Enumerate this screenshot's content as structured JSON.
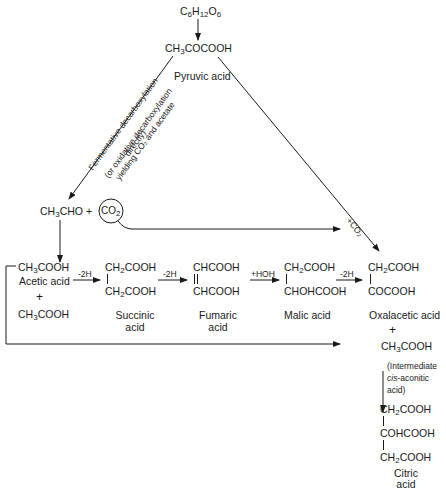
{
  "diagram": {
    "glucose": {
      "prefix": "C",
      "sub1": "6",
      "mid": "H",
      "sub2": "12",
      "mid2": "O",
      "sub3": "6"
    },
    "pyruvic": {
      "formula_a": "CH",
      "sub": "3",
      "formula_b": "COCOOH",
      "name": "Pyruvic acid"
    },
    "decarb_label": {
      "line1": "Fermentative decarboxylation",
      "line2": "(or oxidative decarboxylation",
      "line3": "yielding CO₂ and acetate",
      "line4": "directly)"
    },
    "acetaldehyde": {
      "formula_a": "CH",
      "sub": "3",
      "formula_b": "CHO +"
    },
    "co2_circle": {
      "a": "CO",
      "sub": "2"
    },
    "co2_add_label": "+CO₂",
    "acetic": {
      "formula_a": "CH",
      "sub": "3",
      "formula_b": "COOH",
      "name": "Acetic acid",
      "plus": "+"
    },
    "acetic2": {
      "formula_a": "CH",
      "sub": "3",
      "formula_b": "COOH"
    },
    "steps": {
      "s1": "-2H",
      "s2": "-2H",
      "s3": "+HOH",
      "s4": "-2H"
    },
    "succinic": {
      "top_a": "CH",
      "top_sub": "2",
      "top_b": "COOH",
      "bot_a": "CH",
      "bot_sub": "2",
      "bot_b": "COOH",
      "name1": "Succinic",
      "name2": "acid"
    },
    "fumaric": {
      "top": "CHCOOH",
      "bot": "CHCOOH",
      "name1": "Fumaric",
      "name2": "acid"
    },
    "malic": {
      "top_a": "CH",
      "top_sub": "2",
      "top_b": "COOH",
      "bot": "CHOHCOOH",
      "name": "Malic acid"
    },
    "oxalacetic": {
      "top_a": "CH",
      "top_sub": "2",
      "top_b": "COOH",
      "bot": "COCOOH",
      "name": "Oxalacetic acid",
      "plus": "+"
    },
    "acetic3": {
      "formula_a": "CH",
      "sub": "3",
      "formula_b": "COOH"
    },
    "intermediate": {
      "line1": "(Intermediate",
      "line2_italic": "cis",
      "line2_rest": "-aconitic",
      "line3": "acid)"
    },
    "citric": {
      "l1_a": "CH",
      "l1_sub": "2",
      "l1_b": "COOH",
      "l2": "COHCOOH",
      "l3_a": "CH",
      "l3_sub": "2",
      "l3_b": "COOH",
      "name1": "Citric",
      "name2": "acid"
    }
  }
}
